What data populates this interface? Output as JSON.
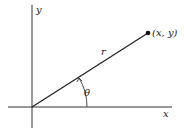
{
  "diagram": {
    "labels": {
      "x_axis": "x",
      "y_axis": "y",
      "radius": "r",
      "angle": "θ",
      "point": "(x, y)"
    },
    "colors": {
      "line": "#222222",
      "background": "#ffffff"
    }
  }
}
